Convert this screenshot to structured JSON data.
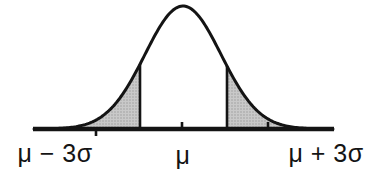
{
  "diagram": {
    "type": "normal-distribution-bell-curve",
    "axis_labels": {
      "left": "μ − 3σ",
      "center": "μ",
      "right": "μ + 3σ"
    },
    "colors": {
      "curve": "#141414",
      "text": "#141414",
      "shading_base": "#c9c9c9",
      "shading_dot": "#9c9c9c",
      "background": "#ffffff"
    },
    "geometry": {
      "width": 373,
      "height": 180,
      "center_x": 183,
      "baseline_y": 129,
      "baseline_x1": 34,
      "baseline_x2": 333,
      "amplitude": 123,
      "sigma_px": 38,
      "shade_cut_left_x": 140,
      "shade_cut_right_x": 227,
      "curve_stroke": 3,
      "baseline_stroke": 4.5,
      "vline_stroke": 2.6,
      "ticks": [
        {
          "x": 96,
          "dir": "down"
        },
        {
          "x": 182,
          "dir": "up"
        },
        {
          "x": 268,
          "dir": "up"
        }
      ]
    }
  }
}
